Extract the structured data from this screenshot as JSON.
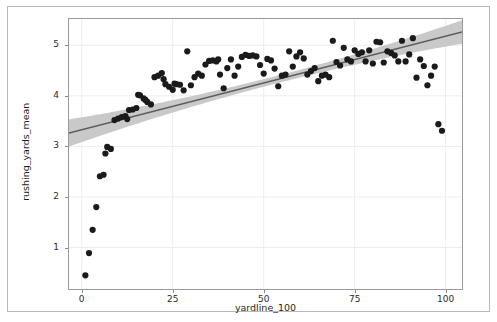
{
  "figure": {
    "background_color": "#ffffff",
    "frame_color": "#9a9a9a",
    "outer_border_color": "#b9b9b9"
  },
  "chart_data": {
    "type": "scatter",
    "title": "",
    "xlabel": "yardline_100",
    "ylabel": "rushing_yards_mean",
    "xlim": [
      -3.5,
      104.5
    ],
    "ylim": [
      0.18,
      5.52
    ],
    "xticks": [
      0,
      25,
      50,
      75,
      100
    ],
    "xticklabels": [
      "0",
      "25",
      "50",
      "75",
      "100"
    ],
    "yticks": [
      1,
      2,
      3,
      4,
      5
    ],
    "yticklabels": [
      "1",
      "2",
      "3",
      "4",
      "5"
    ],
    "grid": true,
    "grid_color": "#ededed",
    "legend": null,
    "marker_color": "#1a1a1a",
    "marker_size": 3.1,
    "regression": {
      "type": "linear-fit",
      "line_color": "#5c5c5c",
      "band_color": "#c9c9c9",
      "band_label": "95% confidence interval",
      "intercept": 3.33,
      "slope": 0.0185,
      "band_halfwidth_at_x0": 0.245,
      "band_halfwidth_at_x50": 0.075,
      "band_halfwidth_at_x100": 0.205
    },
    "x": [
      1.0,
      2.0,
      3.0,
      4.0,
      5.0,
      6.0,
      6.5,
      7.0,
      8.0,
      9.0,
      10.0,
      11.0,
      12.0,
      12.5,
      13.0,
      14.0,
      15.0,
      15.5,
      16.0,
      17.0,
      17.5,
      18.0,
      19.0,
      20.0,
      21.0,
      22.0,
      22.5,
      23.0,
      24.0,
      25.0,
      25.5,
      26.0,
      27.0,
      28.0,
      29.0,
      30.0,
      31.0,
      32.0,
      33.0,
      34.0,
      35.0,
      36.0,
      37.0,
      37.5,
      38.0,
      39.0,
      40.0,
      41.0,
      42.0,
      43.0,
      44.0,
      45.0,
      46.0,
      47.0,
      48.0,
      49.0,
      50.0,
      51.0,
      52.0,
      53.0,
      54.0,
      55.0,
      56.0,
      57.0,
      58.0,
      59.0,
      60.0,
      61.0,
      62.0,
      63.0,
      64.0,
      65.0,
      66.0,
      67.0,
      68.0,
      69.0,
      70.0,
      71.0,
      72.0,
      73.0,
      74.0,
      75.0,
      76.0,
      77.0,
      78.0,
      79.0,
      80.0,
      81.0,
      82.0,
      83.0,
      84.0,
      85.0,
      86.0,
      87.0,
      88.0,
      89.0,
      90.0,
      91.0,
      92.0,
      93.0,
      94.0,
      95.0,
      96.0,
      97.0,
      98.0,
      99.0
    ],
    "y": [
      0.45,
      0.89,
      1.35,
      1.8,
      2.41,
      2.44,
      2.86,
      2.99,
      2.95,
      3.52,
      3.55,
      3.58,
      3.6,
      3.54,
      3.72,
      3.73,
      3.76,
      4.02,
      4.01,
      3.95,
      3.92,
      3.88,
      3.83,
      4.37,
      4.4,
      4.45,
      4.33,
      4.23,
      4.18,
      4.12,
      4.24,
      4.23,
      4.22,
      4.11,
      4.88,
      4.21,
      4.37,
      4.44,
      4.4,
      4.62,
      4.69,
      4.7,
      4.68,
      4.72,
      4.42,
      4.15,
      4.55,
      4.72,
      4.4,
      4.58,
      4.77,
      4.81,
      4.79,
      4.8,
      4.78,
      4.61,
      4.44,
      4.73,
      4.7,
      4.54,
      4.19,
      4.4,
      4.42,
      4.88,
      4.58,
      4.78,
      4.86,
      4.74,
      4.42,
      4.49,
      4.55,
      4.29,
      4.4,
      4.42,
      4.37,
      5.09,
      4.67,
      4.6,
      4.95,
      4.72,
      4.68,
      4.9,
      4.83,
      4.86,
      4.68,
      4.9,
      4.64,
      5.07,
      5.06,
      4.66,
      4.88,
      4.85,
      4.8,
      4.68,
      5.09,
      4.68,
      4.82,
      5.14,
      4.36,
      4.72,
      4.59,
      4.21,
      4.4,
      4.58,
      3.44,
      3.31
    ]
  }
}
